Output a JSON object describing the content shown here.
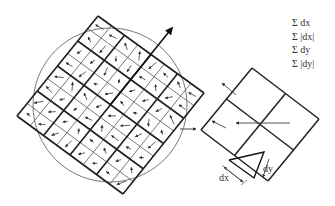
{
  "figure": {
    "main_grid": {
      "corners": {
        "top": [
          98,
          16
        ],
        "right": [
          204,
          93
        ],
        "bottom": [
          123,
          194
        ],
        "left": [
          17,
          116
        ]
      },
      "major_divisions": 4,
      "minor_divisions": 8,
      "circle": {
        "cx": 110,
        "cy": 105,
        "r": 77
      },
      "orientation_arrow": {
        "from": [
          110,
          105
        ],
        "to": [
          172,
          28
        ]
      },
      "side_arrow": {
        "from": [
          180,
          129
        ],
        "to": [
          196,
          129
        ]
      }
    },
    "detail_grid": {
      "corners": {
        "top": [
          252,
          68
        ],
        "right": [
          319,
          119
        ],
        "bottom": [
          268,
          181
        ],
        "left": [
          201,
          130
        ]
      },
      "divisions": 2
    },
    "legend": [
      "Σ  dx",
      "Σ |dx|",
      "Σ  dy",
      "Σ |dy|"
    ],
    "labels": {
      "dx": "dx",
      "dy": "dy"
    }
  }
}
